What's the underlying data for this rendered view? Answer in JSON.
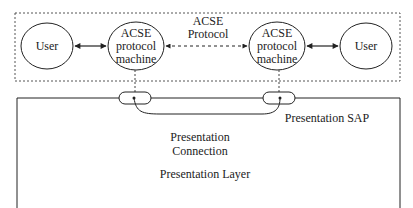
{
  "diagram": {
    "left_user": "User",
    "right_user": "User",
    "left_machine": [
      "ACSE",
      "protocol",
      "machine"
    ],
    "right_machine": [
      "ACSE",
      "protocol",
      "machine"
    ],
    "acse_protocol": [
      "ACSE",
      "Protocol"
    ],
    "presentation_sap": "Presentation SAP",
    "presentation_connection": [
      "Presentation",
      "Connection"
    ],
    "presentation_layer": "Presentation Layer"
  }
}
